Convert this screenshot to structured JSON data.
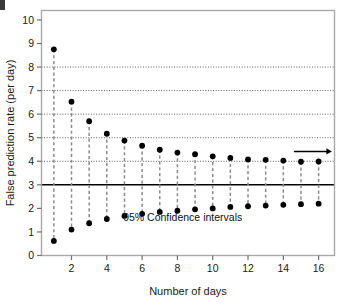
{
  "figure": {
    "corner_mark": "crop-mark",
    "annotation": "95% Confidence intervals",
    "arrow": "right-arrow-trend-marker"
  },
  "chart_data": {
    "type": "scatter",
    "title": "",
    "xlabel": "Number of days",
    "ylabel": "False prediction rate (per day)",
    "xlim": [
      0.3,
      16.9
    ],
    "ylim": [
      0,
      10.4
    ],
    "grid": true,
    "grid_style": "dotted",
    "gridlines_y": [
      4,
      5,
      6,
      7,
      8
    ],
    "reference_line_y": 3,
    "reference_line_style": "solid",
    "legend": "none",
    "xticks": [
      2,
      4,
      6,
      8,
      10,
      12,
      14,
      16
    ],
    "xticklabels": [
      "2",
      "4",
      "6",
      "8",
      "10",
      "12",
      "14",
      "16"
    ],
    "yticks": [
      0,
      1,
      2,
      3,
      4,
      5,
      6,
      7,
      8,
      9,
      10
    ],
    "yticklabels": [
      "0",
      "1",
      "2",
      "3",
      "4",
      "5",
      "6",
      "7",
      "8",
      "9",
      "10"
    ],
    "x": [
      1,
      2,
      3,
      4,
      5,
      6,
      7,
      8,
      9,
      10,
      11,
      12,
      13,
      14,
      15,
      16
    ],
    "series": [
      {
        "name": "Upper 95% confidence limit",
        "values": [
          8.75,
          6.53,
          5.7,
          5.17,
          4.88,
          4.66,
          4.49,
          4.37,
          4.3,
          4.21,
          4.14,
          4.08,
          4.06,
          4.03,
          3.98,
          3.99
        ]
      },
      {
        "name": "Lower 95% confidence limit",
        "values": [
          0.62,
          1.1,
          1.37,
          1.55,
          1.68,
          1.77,
          1.85,
          1.9,
          1.96,
          2.0,
          2.06,
          2.09,
          2.12,
          2.15,
          2.18,
          2.2
        ]
      }
    ],
    "annotations": [
      {
        "text": "95% Confidence intervals",
        "x": 8.3,
        "y": 1.45
      }
    ]
  }
}
